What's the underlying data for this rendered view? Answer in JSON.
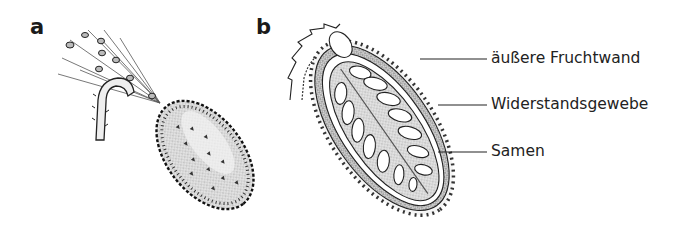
{
  "figure": {
    "panels": [
      {
        "letter": "a",
        "subject": "whole fruit ejecting seeds"
      },
      {
        "letter": "b",
        "subject": "longitudinal section of fruit"
      }
    ],
    "callouts": [
      {
        "text": "äußere Fruchtwand"
      },
      {
        "text": "Widerstandsgewebe"
      },
      {
        "text": "Samen"
      }
    ],
    "colors": {
      "ink": "#1a1a1a",
      "stipple": "#9a9a9a",
      "background": "#ffffff"
    }
  }
}
